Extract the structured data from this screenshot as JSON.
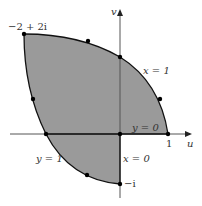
{
  "figure": {
    "axes": {
      "horizontal_label": "u",
      "vertical_label": "v",
      "tick_one_label": "1",
      "minus_i_label": "−i"
    },
    "corner_label": "−2 + 2i",
    "curve_labels": {
      "x_eq_1": "x = 1",
      "y_eq_0": "y = 0",
      "y_eq_1": "y = 1",
      "x_eq_0": "x = 0"
    },
    "colors": {
      "region_fill": "#9a9a9a",
      "boundary": "#111111",
      "axis": "#555555"
    },
    "marked_points": [
      {
        "w": "-2+2i"
      },
      {
        "w": "-0.64+1.72i"
      },
      {
        "w": "0+1.5i"
      },
      {
        "w": "0.8+0.72i"
      },
      {
        "w": "1"
      },
      {
        "w": "0"
      },
      {
        "w": "-1.5"
      },
      {
        "w": "-1.72+0.72i"
      },
      {
        "w": "-0.66-0.86i"
      },
      {
        "w": "-i"
      }
    ]
  }
}
